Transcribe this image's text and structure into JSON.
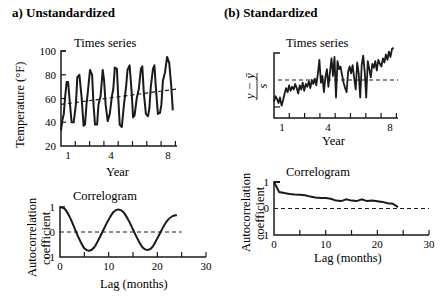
{
  "panels": {
    "left": {
      "title": "a) Unstandardized",
      "timeseries": {
        "title": "Times series",
        "xlabel": "Year",
        "ylabel": "Temperature (°F)",
        "yticks": [
          "100",
          "80",
          "60",
          "40",
          "20"
        ],
        "xticks": [
          "1",
          "4",
          "8"
        ]
      },
      "correlogram": {
        "title": "Correlogram",
        "ylabel_line1": "Autocorrelation",
        "ylabel_line2": "coefficient",
        "xlabel": "Lag (months)",
        "yticks": [
          "1",
          "0",
          "−1"
        ],
        "xticks": [
          "0",
          "10",
          "20",
          "30"
        ]
      }
    },
    "right": {
      "title": "(b) Standardized",
      "timeseries": {
        "title": "Times series",
        "xlabel": "Year",
        "ylabel_num": "y − ȳ",
        "ylabel_den": "s",
        "xticks": [
          "1",
          "4",
          "8"
        ]
      },
      "correlogram": {
        "title": "Correlogram",
        "ylabel_line1": "Autocorrelation",
        "ylabel_line2": "coefficient",
        "xlabel": "Lag (months)",
        "yticks": [
          "1",
          "0",
          "−1"
        ],
        "xticks": [
          "0",
          "10",
          "20",
          "30"
        ]
      }
    }
  },
  "chart_data": [
    {
      "type": "line",
      "title": "Times series (Unstandardized)",
      "xlabel": "Year",
      "ylabel": "Temperature (°F)",
      "ylim": [
        20,
        100
      ],
      "xlim": [
        0.7,
        8.9
      ],
      "series": [
        {
          "name": "monthly temperature",
          "x": [
            0.7,
            0.8,
            0.9,
            1.0,
            1.1,
            1.2,
            1.3,
            1.45,
            1.6,
            1.75,
            1.85,
            2.0,
            2.15,
            2.3,
            2.4,
            2.5,
            2.6,
            2.75,
            2.9,
            3.0,
            3.1,
            3.25,
            3.35,
            3.5,
            3.65,
            3.75,
            3.85,
            4.0,
            4.15,
            4.3,
            4.4,
            4.5,
            4.65,
            4.75,
            4.85,
            5.0,
            5.15,
            5.3,
            5.4,
            5.55,
            5.7,
            5.8,
            5.9,
            6.05,
            6.2,
            6.35,
            6.45,
            6.55,
            6.7,
            6.85,
            6.95,
            7.05,
            7.2,
            7.3,
            7.4,
            7.55,
            7.7,
            7.8,
            7.9,
            8.05,
            8.2,
            8.35,
            8.5,
            8.6
          ],
          "y": [
            33,
            42,
            47,
            62,
            74,
            74,
            60,
            40,
            40,
            55,
            78,
            80,
            62,
            37,
            38,
            55,
            66,
            84,
            80,
            55,
            38,
            38,
            55,
            62,
            84,
            75,
            55,
            41,
            47,
            62,
            68,
            86,
            85,
            60,
            38,
            36,
            55,
            70,
            84,
            88,
            65,
            44,
            46,
            60,
            68,
            85,
            87,
            65,
            47,
            45,
            52,
            70,
            85,
            88,
            70,
            47,
            48,
            55,
            75,
            82,
            95,
            90,
            70,
            50
          ]
        },
        {
          "name": "trend (dashed)",
          "x": [
            0.7,
            8.9
          ],
          "y": [
            55,
            68
          ]
        }
      ]
    },
    {
      "type": "line",
      "title": "Correlogram (Unstandardized)",
      "xlabel": "Lag (months)",
      "ylabel": "Autocorrelation coefficient",
      "ylim": [
        -1,
        1
      ],
      "xlim": [
        0,
        30
      ],
      "series": [
        {
          "name": "autocorrelation",
          "x": [
            0,
            1,
            2,
            3,
            4,
            5,
            6,
            7,
            8,
            9,
            10,
            11,
            12,
            13,
            14,
            15,
            16,
            17,
            18,
            19,
            20,
            21,
            22,
            23,
            24
          ],
          "y": [
            1.0,
            0.92,
            0.6,
            0.15,
            -0.3,
            -0.65,
            -0.75,
            -0.62,
            -0.28,
            0.12,
            0.5,
            0.8,
            0.9,
            0.8,
            0.5,
            0.1,
            -0.3,
            -0.62,
            -0.72,
            -0.6,
            -0.25,
            0.12,
            0.45,
            0.62,
            0.68
          ]
        },
        {
          "name": "zero line (dashed)",
          "x": [
            0,
            25
          ],
          "y": [
            0,
            0
          ]
        }
      ]
    },
    {
      "type": "line",
      "title": "Times series (Standardized)",
      "xlabel": "Year",
      "ylabel": "(y − ȳ)/s",
      "series": [
        {
          "name": "standardized temperature",
          "x": [
            0.7,
            0.8,
            0.9,
            1.0,
            1.1,
            1.2,
            1.3,
            1.4,
            1.5,
            1.6,
            1.7,
            1.8,
            1.9,
            2.0,
            2.1,
            2.2,
            2.3,
            2.4,
            2.5,
            2.6,
            2.7,
            2.8,
            2.9,
            3.0,
            3.1,
            3.2,
            3.3,
            3.4,
            3.5,
            3.6,
            3.7,
            3.8,
            3.9,
            4.0,
            4.1,
            4.2,
            4.3,
            4.4,
            4.5,
            4.6,
            4.7,
            4.8,
            4.9,
            5.0,
            5.1,
            5.2,
            5.3,
            5.4,
            5.5,
            5.6,
            5.7,
            5.8,
            5.9,
            6.0,
            6.1,
            6.2,
            6.3,
            6.4,
            6.5,
            6.6,
            6.7,
            6.8,
            6.9,
            7.0,
            7.1,
            7.2,
            7.3,
            7.4,
            7.5,
            7.6,
            7.7,
            7.8,
            7.9,
            8.0,
            8.1,
            8.2,
            8.3,
            8.4,
            8.5,
            8.6
          ],
          "y": [
            -1.6,
            -1.2,
            -1.4,
            -1.7,
            -1.3,
            -1.9,
            -1.5,
            -1.0,
            -0.6,
            -0.9,
            -0.4,
            -0.8,
            -0.5,
            -0.7,
            -0.3,
            -0.6,
            -1.0,
            -0.4,
            -0.7,
            -0.2,
            -0.8,
            -0.3,
            -0.5,
            -0.1,
            -0.6,
            0.0,
            -0.3,
            0.1,
            -0.4,
            0.5,
            1.5,
            -0.2,
            0.3,
            -0.9,
            0.2,
            0.8,
            -0.5,
            0.6,
            1.6,
            0.3,
            1.7,
            -1.3,
            1.4,
            0.8,
            1.0,
            0.4,
            -0.2,
            -0.6,
            -0.9,
            0.6,
            1.0,
            0.5,
            1.1,
            0.2,
            -0.7,
            1.3,
            0.5,
            -1.3,
            1.1,
            1.8,
            0.6,
            -1.3,
            1.4,
            0.8,
            0.2,
            1.2,
            0.9,
            1.4,
            0.7,
            1.5,
            1.2,
            1.0,
            1.6,
            1.3,
            1.9,
            1.5,
            2.1,
            1.7,
            2.3,
            2.4
          ]
        },
        {
          "name": "mean (dashed)",
          "x": [
            0.7,
            8.9
          ],
          "y": [
            0,
            0
          ]
        }
      ]
    },
    {
      "type": "line",
      "title": "Correlogram (Standardized)",
      "xlabel": "Lag (months)",
      "ylabel": "Autocorrelation coefficient",
      "ylim": [
        -1,
        1
      ],
      "xlim": [
        0,
        30
      ],
      "series": [
        {
          "name": "autocorrelation",
          "x": [
            0,
            1,
            2,
            3,
            4,
            5,
            6,
            7,
            8,
            9,
            10,
            11,
            12,
            13,
            14,
            15,
            16,
            17,
            18,
            19,
            20,
            21,
            22,
            23,
            24
          ],
          "y": [
            1.0,
            0.62,
            0.58,
            0.55,
            0.53,
            0.52,
            0.5,
            0.45,
            0.42,
            0.4,
            0.4,
            0.37,
            0.3,
            0.28,
            0.35,
            0.3,
            0.28,
            0.35,
            0.28,
            0.3,
            0.27,
            0.25,
            0.2,
            0.18,
            0.05
          ]
        },
        {
          "name": "zero line (dashed)",
          "x": [
            0,
            30
          ],
          "y": [
            0,
            0
          ]
        }
      ]
    }
  ]
}
